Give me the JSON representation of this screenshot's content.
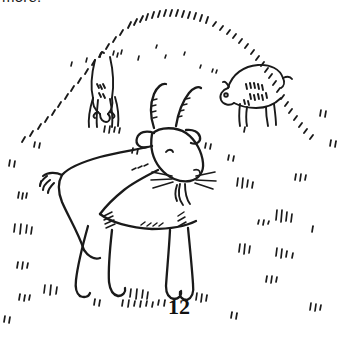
{
  "page": {
    "background_color": "#ffffff",
    "ink_color": "#1a1a1a",
    "width": 345,
    "height": 337
  },
  "top_caption": {
    "text": "more.",
    "note": "cropped — only bottom sliver of letters visible at top edge"
  },
  "illustration": {
    "title": "Goats grazing on a hillside",
    "style": "black ink line drawing, hand-drawn, no shading",
    "scene_elements": [
      "grassy hill drawn as an arc of short dash strokes",
      "large billy goat in foreground, standing in profile facing right",
      "goat in middle distance, rear view, head lowered grazing",
      "goat on the right, profile facing left, head lowered grazing",
      "scattered tufts of grass across the field"
    ],
    "foreground_goat": {
      "features": [
        "two long curved horns",
        "two ears",
        "eye",
        "muzzle",
        "whiskers",
        "beard",
        "tail",
        "four legs with hooves"
      ],
      "facing": "right"
    },
    "background_goats": [
      {
        "position": "upper-left",
        "pose": "rear view, head down grazing"
      },
      {
        "position": "upper-right",
        "pose": "side view facing left, head down grazing"
      }
    ],
    "grass_tufts_count": 24
  },
  "page_number": {
    "label": "12"
  }
}
